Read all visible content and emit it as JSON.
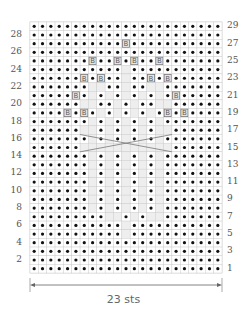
{
  "chart_data": {
    "type": "table",
    "columns": 23,
    "rows": 29,
    "width_label": "23 sts",
    "legend_symbols": {
      ".": "purl (dot)",
      "B": "knit through back loop (boxed B)",
      "_": "knit (blank)"
    },
    "grid_rows_top_to_bottom": [
      {
        "row": 29,
        "cells": "......................."
      },
      {
        "row": 28,
        "cells": "......................."
      },
      {
        "row": 27,
        "cells": "...........B..........."
      },
      {
        "row": 26,
        "cells": "......................."
      },
      {
        "row": 25,
        "cells": ".......B..B.B..B......."
      },
      {
        "row": 24,
        "cells": "..........._..........."
      },
      {
        "row": 23,
        "cells": "......B.B.._..B.B......"
      },
      {
        "row": 22,
        "cells": ".......__.._..__......."
      },
      {
        "row": 21,
        "cells": ".....B._._._._._.B....."
      },
      {
        "row": 20,
        "cells": "......__.._._..__......"
      },
      {
        "row": 19,
        "cells": "....B.B._._._._.B.B...."
      },
      {
        "row": 18,
        "cells": "......._._._._._......."
      },
      {
        "row": 17,
        "cells": "......__._._._.__......"
      },
      {
        "row": 16,
        "cells": "......._._._._._......."
      },
      {
        "row": 15,
        "cells": "......___________......"
      },
      {
        "row": 14,
        "cells": "......._._._._._......."
      },
      {
        "row": 13,
        "cells": "......._._._._._......."
      },
      {
        "row": 12,
        "cells": "......._._._._._......."
      },
      {
        "row": 11,
        "cells": "......._._._._._......."
      },
      {
        "row": 10,
        "cells": "......._._._._._......."
      },
      {
        "row": 9,
        "cells": "......._._._._._......."
      },
      {
        "row": 8,
        "cells": "......._._._._._......."
      },
      {
        "row": 7,
        "cells": ".........__._.__......."
      },
      {
        "row": 6,
        "cells": "..........._..........."
      },
      {
        "row": 5,
        "cells": "..........._..........."
      },
      {
        "row": 4,
        "cells": "......................."
      },
      {
        "row": 3,
        "cells": "......................."
      },
      {
        "row": 2,
        "cells": "......................."
      },
      {
        "row": 1,
        "cells": "......................."
      }
    ],
    "left_row_labels": [
      "28",
      "26",
      "24",
      "22",
      "20",
      "18",
      "16",
      "14",
      "12",
      "10",
      "8",
      "6",
      "4",
      "2"
    ],
    "right_row_labels": [
      "29",
      "27",
      "25",
      "23",
      "21",
      "19",
      "17",
      "15",
      "13",
      "11",
      "9",
      "7",
      "5",
      "3",
      "1"
    ],
    "cable_crossing_rows": [
      15,
      16
    ],
    "colors": {
      "grid": "#c8c8c8",
      "blank_fill": "#eeeeee",
      "dot": "#111111",
      "box": "#777777",
      "outline": "#777777"
    }
  },
  "labels": {
    "width": "23 sts",
    "left": [
      "28",
      "26",
      "24",
      "22",
      "20",
      "18",
      "16",
      "14",
      "12",
      "10",
      "8",
      "6",
      "4",
      "2"
    ],
    "right": [
      "29",
      "27",
      "25",
      "23",
      "21",
      "19",
      "17",
      "15",
      "13",
      "11",
      "9",
      "7",
      "5",
      "3",
      "1"
    ]
  }
}
